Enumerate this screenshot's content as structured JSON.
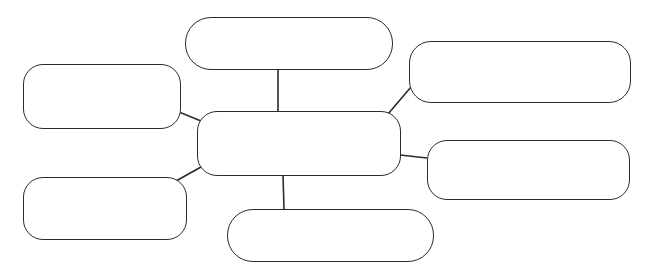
{
  "diagram": {
    "type": "spider-map",
    "title": "",
    "stroke_color": "#2b2b2b",
    "background": "#ffffff",
    "center": {
      "id": "center",
      "label": "",
      "x": 197,
      "y": 111,
      "w": 204,
      "h": 65,
      "r": 20
    },
    "branches": [
      {
        "id": "top",
        "label": "",
        "x": 185,
        "y": 17,
        "w": 208,
        "h": 53,
        "r": 26
      },
      {
        "id": "top-right",
        "label": "",
        "x": 409,
        "y": 41,
        "w": 222,
        "h": 62,
        "r": 22
      },
      {
        "id": "left-top",
        "label": "",
        "x": 23,
        "y": 64,
        "w": 158,
        "h": 65,
        "r": 20
      },
      {
        "id": "right-bottom",
        "label": "",
        "x": 427,
        "y": 140,
        "w": 203,
        "h": 60,
        "r": 20
      },
      {
        "id": "left-bottom",
        "label": "",
        "x": 23,
        "y": 177,
        "w": 164,
        "h": 63,
        "r": 20
      },
      {
        "id": "bottom",
        "label": "",
        "x": 227,
        "y": 209,
        "w": 207,
        "h": 53,
        "r": 26
      }
    ],
    "links": [
      {
        "from": "top",
        "to": "center",
        "x1": 278,
        "y1": 69,
        "x2": 278,
        "y2": 111
      },
      {
        "from": "top-right",
        "to": "center",
        "x1": 411,
        "y1": 87,
        "x2": 388,
        "y2": 114
      },
      {
        "from": "left-top",
        "to": "center",
        "x1": 179,
        "y1": 112,
        "x2": 201,
        "y2": 121
      },
      {
        "from": "right-bottom",
        "to": "center",
        "x1": 400,
        "y1": 155,
        "x2": 427,
        "y2": 158
      },
      {
        "from": "left-bottom",
        "to": "center",
        "x1": 176,
        "y1": 181,
        "x2": 201,
        "y2": 167
      },
      {
        "from": "bottom",
        "to": "center",
        "x1": 283,
        "y1": 175,
        "x2": 284,
        "y2": 209
      }
    ]
  }
}
